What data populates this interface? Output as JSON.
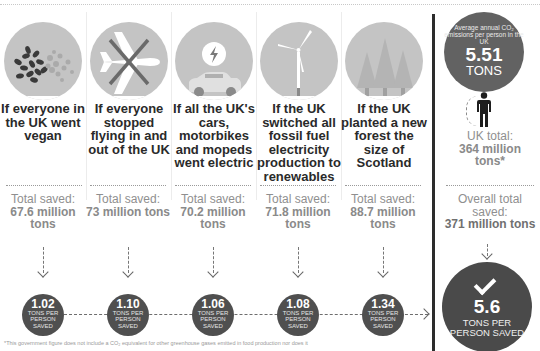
{
  "scenarios": [
    {
      "icon": "beans-icon",
      "headline": "If everyone in the UK went vegan",
      "total_label": "Total saved:",
      "total_value": "67.6 million tons",
      "per_person_value": "1.02",
      "per_person_unit": "TONS PER PERSON SAVED"
    },
    {
      "icon": "crossed-plane-icon",
      "headline": "If everyone stopped flying in and out of the UK",
      "total_label": "Total saved:",
      "total_value": "73 million tons",
      "per_person_value": "1.10",
      "per_person_unit": "TONS PER PERSON SAVED"
    },
    {
      "icon": "electric-car-icon",
      "headline": "If all the UK's cars, motorbikes and mopeds went electric",
      "total_label": "Total saved:",
      "total_value": "70.2 million tons",
      "per_person_value": "1.06",
      "per_person_unit": "TONS PER PERSON SAVED"
    },
    {
      "icon": "wind-turbine-icon",
      "headline": "If the UK switched all fossil fuel electricity production to renewables",
      "total_label": "Total saved:",
      "total_value": "71.8 million tons",
      "per_person_value": "1.08",
      "per_person_unit": "TONS PER PERSON SAVED"
    },
    {
      "icon": "forest-icon",
      "headline": "If the UK planted a new forest the size of Scotland",
      "total_label": "Total saved:",
      "total_value": "88.7 million tons",
      "per_person_value": "1.34",
      "per_person_unit": "TONS PER PERSON SAVED"
    }
  ],
  "average": {
    "caption": "Average annual CO₂ emissions per person in the UK",
    "value": "5.51",
    "unit": "TONS",
    "uk_total_label": "UK total:",
    "uk_total_value": "364 million tons*"
  },
  "overall": {
    "label": "Overall total saved:",
    "value": "371 million tons",
    "per_person_value": "5.6",
    "per_person_unit": "TONS PER PERSON SAVED"
  },
  "footnote": "*This government figure does not include a CO₂ equivalent for other greenhouse gases emitted in food production nor does it"
}
